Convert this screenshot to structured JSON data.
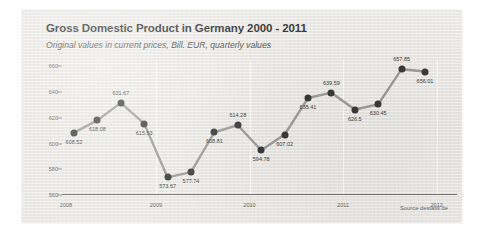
{
  "chart_data": {
    "type": "line",
    "title": "Gross Domestic Product in Germany 2000 - 2011",
    "subtitle": "Original values in current prices, Bill. EUR, quarterly values",
    "xlabel": "",
    "ylabel": "",
    "ylim": [
      560,
      665
    ],
    "yticks": [
      "660",
      "640",
      "620",
      "600",
      "580",
      "560"
    ],
    "ytick_values": [
      660,
      640,
      620,
      600,
      580,
      560
    ],
    "xticks": [
      "2008",
      "2009",
      "2010",
      "2011",
      "2012"
    ],
    "xtick_values": [
      2008,
      2009,
      2010,
      2011,
      2012
    ],
    "grid": false,
    "legend": "none",
    "series_color": "#9a9a9a",
    "marker_color": "#3a3a3a",
    "x": [
      "2008 Q1",
      "2008 Q2",
      "2008 Q3",
      "2008 Q4",
      "2009 Q1",
      "2009 Q2",
      "2009 Q3",
      "2009 Q4",
      "2010 Q1",
      "2010 Q2",
      "2010 Q3",
      "2010 Q4",
      "2011 Q1",
      "2011 Q2",
      "2011 Q3",
      "2011 Q4"
    ],
    "values": [
      608.52,
      618.08,
      631.67,
      615.53,
      573.67,
      577.74,
      608.81,
      614.28,
      594.78,
      607.02,
      635.41,
      639.59,
      626.5,
      630.45,
      657.85,
      656.01
    ],
    "point_labels": [
      "608.52",
      "618.08",
      "631.67",
      "615.53",
      "573.67",
      "577.74",
      "608.81",
      "614.28",
      "594.78",
      "607.02",
      "635.41",
      "639.59",
      "626.5",
      "630.45",
      "657.85",
      "656.01"
    ],
    "label_positions": [
      "below",
      "below",
      "above",
      "below",
      "below",
      "below",
      "below",
      "above",
      "below",
      "below",
      "below",
      "above",
      "below",
      "below",
      "above",
      "below"
    ]
  },
  "source": {
    "text": "Source destatis.de"
  }
}
